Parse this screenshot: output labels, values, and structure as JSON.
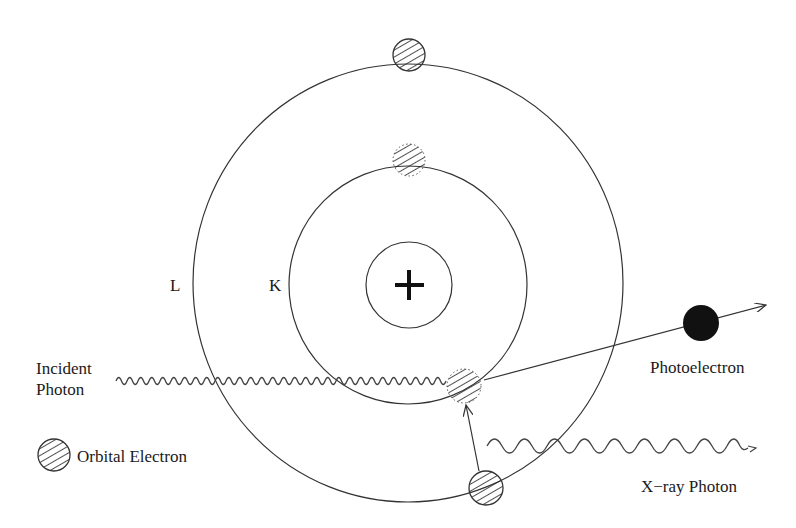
{
  "diagram": {
    "shells": [
      {
        "label": "L",
        "name": "outer-shell"
      },
      {
        "label": "K",
        "name": "inner-shell"
      }
    ],
    "nucleus": {
      "symbol": "+"
    },
    "labels": {
      "incident_line1": "Incident",
      "incident_line2": "Photon",
      "photoelectron": "Photoelectron",
      "xray": "X−ray Photon",
      "legend": "Orbital Electron"
    },
    "colors": {
      "line": "#333333",
      "photoelectron_fill": "#111111",
      "background": "#ffffff"
    }
  }
}
